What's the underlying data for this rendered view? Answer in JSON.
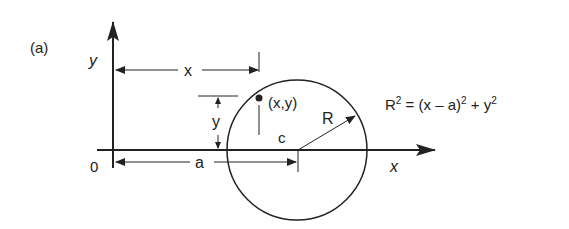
{
  "figure": {
    "panel_label": "(a)",
    "axes": {
      "x_label": "x",
      "y_label": "y",
      "origin_label": "0"
    },
    "dimensions": {
      "x_distance": "x",
      "y_distance": "y",
      "a_distance": "a"
    },
    "point_label": "(x,y)",
    "center_label": "c",
    "radius_label": "R",
    "equation": {
      "lhs": "R",
      "lhs_exp": "2",
      "eq": " = (x – a)",
      "exp1": "2",
      "plus": " + y",
      "exp2": "2"
    }
  }
}
